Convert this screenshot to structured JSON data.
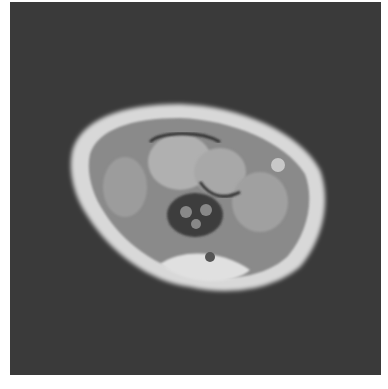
{
  "image": {
    "description": "Axial MRI slice of a wrist on dark background",
    "background_color": "#3a3a3a",
    "border_color": "#ffffff"
  }
}
